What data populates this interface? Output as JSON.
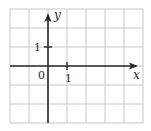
{
  "diagram": {
    "type": "coordinate-plane",
    "grid": {
      "columns": 7,
      "rows": 6,
      "left": 10,
      "top": 9,
      "cell": 19,
      "line_color": "#c8c8c8",
      "axis_color": "#2a2a2a"
    },
    "axes": {
      "y_axis_column": 2,
      "x_axis_row": 3,
      "x_label": "x",
      "y_label": "y",
      "origin_label": "0",
      "x_tick_label": "1",
      "y_tick_label": "1"
    }
  },
  "chart_data": {
    "type": "grid",
    "title": "",
    "xlabel": "x",
    "ylabel": "y",
    "xlim": [
      -2,
      5
    ],
    "ylim": [
      -3,
      3
    ],
    "grid": true,
    "tick_labels": {
      "origin": "0",
      "x": [
        "1"
      ],
      "y": [
        "1"
      ]
    }
  }
}
